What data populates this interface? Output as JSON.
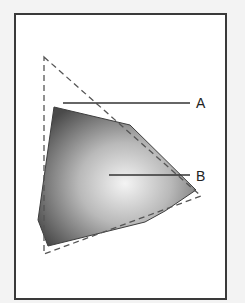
{
  "diagram": {
    "type": "gamut-comparison",
    "labels": {
      "a": "A",
      "b": "B"
    },
    "colors": {
      "background": "#f3f3f3",
      "frame_fill": "#ffffff",
      "frame_stroke": "#3a3a3a",
      "polygon_dark": "#4a4a4a",
      "polygon_light": "#f4f4f4",
      "dashed_stroke": "#555555",
      "leader_stroke": "#333333"
    },
    "shapes": {
      "dashed_triangle": [
        [
          44,
          57
        ],
        [
          201,
          196
        ],
        [
          44,
          254
        ]
      ],
      "filled_polygon": [
        [
          54,
          107
        ],
        [
          130,
          125
        ],
        [
          196,
          190
        ],
        [
          165,
          211
        ],
        [
          145,
          222
        ],
        [
          48,
          246
        ],
        [
          38,
          220
        ]
      ],
      "leader_a": {
        "from": [
          63,
          103
        ],
        "to": [
          190,
          103
        ],
        "label_pos": [
          196,
          108
        ]
      },
      "leader_b": {
        "from": [
          109,
          175
        ],
        "to": [
          190,
          175
        ],
        "label_pos": [
          196,
          181
        ]
      }
    }
  }
}
